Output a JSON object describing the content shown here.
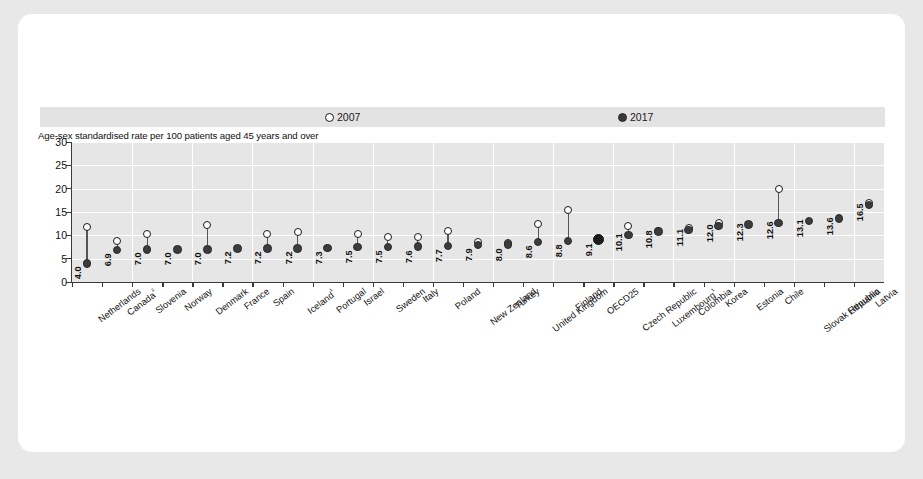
{
  "chart_data": {
    "type": "scatter",
    "title": "",
    "subtitle": "Age-sex standardised rate  per 100 patients aged 45 years and over",
    "xlabel": "",
    "ylabel": "",
    "ylim": [
      0,
      30
    ],
    "yticks": [
      0,
      5,
      10,
      15,
      20,
      25,
      30
    ],
    "grid": true,
    "legend_position": "top",
    "legend": [
      {
        "label": "2007",
        "marker": "open-circle"
      },
      {
        "label": "2017",
        "marker": "filled-circle"
      }
    ],
    "categories": [
      "Netherlands",
      "Canada²",
      "Slovenia",
      "Norway",
      "Denmark",
      "France",
      "Spain",
      "Iceland¹",
      "Portugal",
      "Israel",
      "Sweden",
      "Italy",
      "Poland",
      "New Zealand",
      "Turkey",
      "United Kingdom",
      "Finland",
      "OECD25",
      "Czech Republic",
      "Luxembourg¹",
      "Colombia",
      "Korea",
      "Estonia",
      "Chile",
      "Slovak Republic",
      "Lithuania",
      "Latvia"
    ],
    "series": [
      {
        "name": "2017",
        "marker": "filled-circle",
        "values": [
          4.0,
          6.9,
          7.0,
          7.0,
          7.0,
          7.2,
          7.2,
          7.2,
          7.3,
          7.5,
          7.5,
          7.6,
          7.7,
          7.9,
          8.0,
          8.6,
          8.8,
          9.1,
          10.1,
          10.8,
          11.1,
          12.0,
          12.3,
          12.6,
          13.1,
          13.6,
          16.5
        ],
        "data_labels": [
          "4.0",
          "6.9",
          "7.0",
          "7.0",
          "7.0",
          "7.2",
          "7.2",
          "7.2",
          "7.3",
          "7.5",
          "7.5",
          "7.6",
          "7.7",
          "7.9",
          "8.0",
          "8.6",
          "8.8",
          "9.1",
          "10.1",
          "10.8",
          "11.1",
          "12.0",
          "12.3",
          "12.6",
          "13.1",
          "13.6",
          "16.5"
        ]
      },
      {
        "name": "2007",
        "marker": "open-circle",
        "values": [
          11.8,
          8.8,
          10.2,
          null,
          12.2,
          null,
          10.2,
          10.7,
          null,
          10.3,
          9.6,
          9.7,
          11.0,
          8.6,
          8.3,
          12.4,
          15.4,
          null,
          12.0,
          11.0,
          11.6,
          12.7,
          null,
          19.9,
          null,
          null,
          16.9
        ]
      }
    ]
  },
  "highlight_category": "OECD25"
}
